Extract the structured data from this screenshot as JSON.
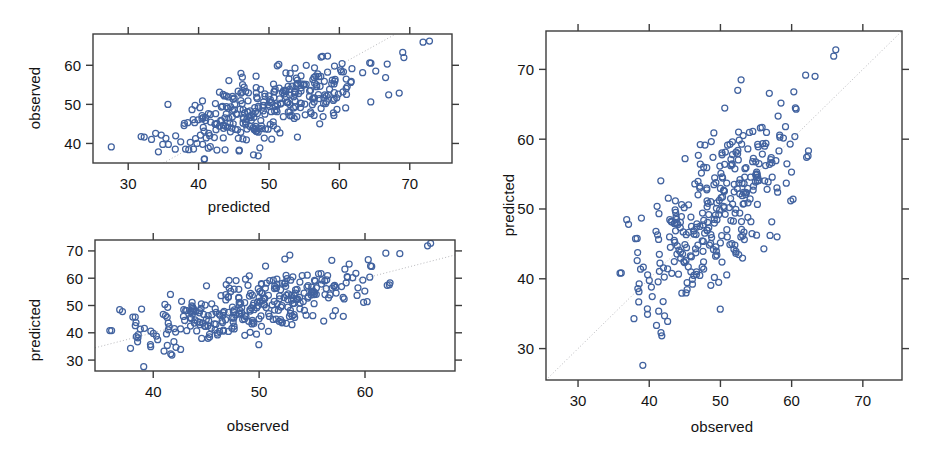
{
  "figure": {
    "background": "#ffffff",
    "point_color": "#41629f",
    "frame_color": "#3c3c3c",
    "refline_color": "#b9b9bd",
    "width": 936,
    "height": 458
  },
  "chart_data": [
    {
      "id": "panel-top-left",
      "type": "scatter",
      "title": "",
      "xlabel": "predicted",
      "ylabel": "observed",
      "xlim": [
        25.0,
        76.0
      ],
      "ylim": [
        35.0,
        68.0
      ],
      "xticks": [
        30,
        40,
        50,
        60,
        70
      ],
      "yticks": [
        40,
        50,
        60
      ],
      "xtick_labels": [
        "30",
        "40",
        "50",
        "60",
        "70"
      ],
      "ytick_labels": [
        "40",
        "50",
        "60"
      ],
      "grid": false,
      "legend": "none",
      "reference_line": {
        "type": "identity",
        "style": "dotted",
        "label": "y = x"
      },
      "marker": {
        "shape": "open-circle",
        "radius_px": 3.0,
        "color": "#41629f"
      },
      "n_points": 330,
      "x": [
        27.4,
        31.5,
        33.2,
        33.4,
        33.5,
        33.6,
        33.7,
        33.8,
        34.0,
        34.1,
        34.3,
        34.4,
        34.6,
        34.8,
        35.0,
        35.1,
        35.3,
        35.5,
        35.6,
        35.8,
        36.0,
        36.2,
        36.4,
        36.6,
        36.8,
        37.0,
        37.2,
        37.4,
        37.6,
        37.8,
        38.0,
        38.2,
        38.4,
        38.6,
        38.8,
        39.0,
        39.2,
        39.4,
        39.6,
        39.8,
        40.0,
        40.2,
        40.4,
        40.6,
        40.8,
        41.0,
        41.2,
        41.4,
        41.6,
        41.8,
        42.0,
        42.2,
        42.4,
        42.6,
        42.8,
        43.0,
        43.2,
        43.4,
        43.6,
        43.8,
        44.0,
        44.2,
        44.4,
        44.6,
        44.8,
        45.0,
        45.2,
        45.4,
        45.6,
        45.8,
        46.0,
        46.2,
        46.4,
        46.6,
        46.8,
        47.0,
        47.2,
        47.4,
        47.6,
        47.8,
        48.0,
        48.2,
        48.4,
        48.6,
        48.8,
        49.0,
        49.2,
        49.4,
        49.6,
        49.8,
        50.0,
        50.2,
        50.4,
        50.6,
        50.8,
        51.0,
        51.2,
        51.4,
        51.6,
        51.8,
        52.0,
        52.2,
        52.4,
        52.6,
        52.8,
        53.0,
        53.2,
        53.4,
        53.6,
        53.8,
        54.0,
        54.2,
        54.4,
        54.6,
        54.8,
        55.0,
        55.2,
        55.4,
        55.6,
        55.8,
        56.0,
        56.2,
        56.4,
        56.6,
        56.8,
        57.0,
        57.2,
        57.4,
        57.6,
        57.8,
        58.0,
        58.2,
        58.4,
        58.6,
        58.8,
        59.0,
        59.2,
        59.4,
        59.6,
        59.8,
        60.0,
        60.2,
        60.4,
        60.6,
        61.0,
        61.4,
        61.8,
        62.2,
        62.6,
        63.0,
        63.4,
        63.8,
        64.2,
        64.6,
        68.5,
        72.8
      ],
      "y": [
        38.8,
        38.7,
        43.5,
        50.2,
        42.4,
        40.5,
        38.9,
        44.1,
        43.0,
        42.1,
        46.5,
        50.0,
        49.8,
        39.7,
        42.6,
        44.3,
        41.2,
        47.9,
        43.8,
        44.8,
        43.5,
        41.9,
        44.0,
        45.9,
        46.1,
        42.4,
        44.9,
        47.2,
        38.0,
        40.4,
        43.7,
        47.5,
        49.5,
        50.0,
        39.6,
        41.5,
        44.2,
        45.6,
        48.1,
        49.9,
        36.8,
        40.0,
        43.1,
        45.4,
        47.3,
        49.2,
        50.3,
        38.6,
        41.6,
        44.5,
        46.4,
        48.2,
        50.0,
        51.0,
        43.0,
        45.5,
        47.1,
        49.0,
        50.8,
        52.5,
        39.8,
        42.5,
        44.8,
        46.8,
        48.6,
        50.2,
        51.8,
        53.5,
        55.8,
        43.5,
        45.0,
        46.9,
        48.5,
        50.1,
        51.6,
        53.1,
        54.5,
        44.2,
        46.3,
        48.0,
        49.5,
        51.0,
        52.4,
        53.8,
        55.3,
        44.8,
        46.8,
        48.4,
        49.9,
        51.3,
        52.7,
        54.1,
        55.5,
        57.0,
        45.1,
        47.0,
        48.6,
        50.1,
        51.5,
        52.9,
        54.3,
        55.7,
        57.2,
        58.5,
        45.5,
        47.4,
        49.0,
        50.5,
        51.9,
        53.3,
        54.7,
        56.1,
        57.6,
        59.0,
        46.0,
        47.9,
        49.5,
        51.0,
        52.4,
        53.8,
        55.2,
        56.6,
        58.1,
        59.5,
        60.8,
        46.5,
        48.4,
        50.0,
        51.5,
        52.9,
        54.3,
        55.7,
        57.1,
        58.6,
        60.0,
        61.2,
        47.0,
        48.9,
        50.5,
        52.0,
        53.4,
        54.8,
        56.2,
        57.6,
        59.1,
        60.5,
        47.5,
        49.4,
        51.0,
        52.5,
        57.5,
        53.9,
        55.3,
        56.7,
        58.2,
        59.6,
        61.0,
        62.0,
        61.5,
        62.3,
        52.9,
        66.2
      ]
    },
    {
      "id": "panel-bottom-left",
      "type": "scatter",
      "title": "",
      "xlabel": "observed",
      "ylabel": "predicted",
      "xlim": [
        34.5,
        68.5
      ],
      "ylim": [
        26.0,
        74.0
      ],
      "xticks": [
        40,
        50,
        60
      ],
      "yticks": [
        30,
        40,
        50,
        60,
        70
      ],
      "xtick_labels": [
        "40",
        "50",
        "60"
      ],
      "ytick_labels": [
        "30",
        "40",
        "50",
        "60",
        "70"
      ],
      "grid": false,
      "legend": "none",
      "reference_line": {
        "type": "identity",
        "style": "dotted",
        "label": "y = x"
      },
      "marker": {
        "shape": "open-circle",
        "radius_px": 3.0,
        "color": "#41629f"
      },
      "n_points": 330
    },
    {
      "id": "panel-right",
      "type": "scatter",
      "title": "",
      "xlabel": "observed",
      "ylabel": "predicted",
      "xlim": [
        25.5,
        75.5
      ],
      "ylim": [
        25.5,
        75.5
      ],
      "xticks": [
        30,
        40,
        50,
        60,
        70
      ],
      "yticks": [
        30,
        40,
        50,
        60,
        70
      ],
      "xtick_labels": [
        "30",
        "40",
        "50",
        "60",
        "70"
      ],
      "ytick_labels": [
        "30",
        "40",
        "50",
        "60",
        "70"
      ],
      "grid": false,
      "legend": "none",
      "reference_line": {
        "type": "identity",
        "style": "dotted",
        "label": "y = x"
      },
      "marker": {
        "shape": "open-circle",
        "radius_px": 3.0,
        "color": "#41629f"
      },
      "n_points": 330
    }
  ],
  "labels": {
    "observed": "observed",
    "predicted": "predicted"
  }
}
